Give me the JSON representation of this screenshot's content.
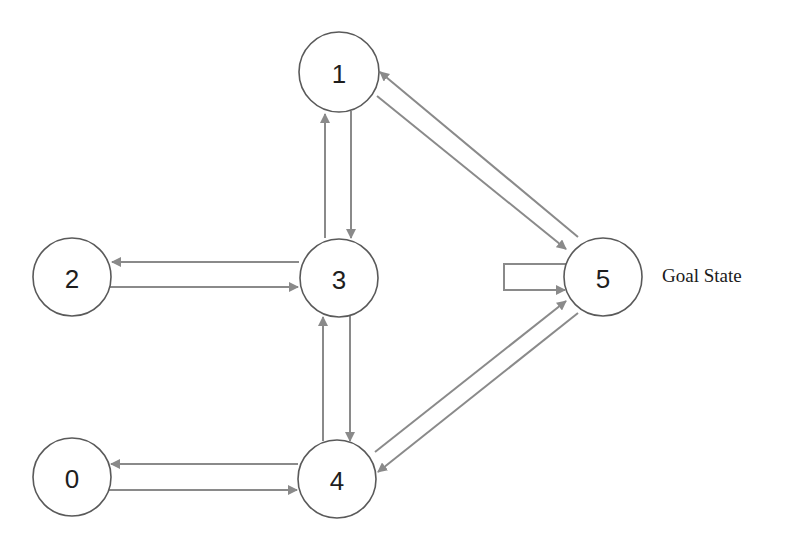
{
  "diagram": {
    "type": "state-transition-graph",
    "colors": {
      "node_stroke": "#5a5a5a",
      "node_fill": "#ffffff",
      "edge": "#8a8a8a",
      "text": "#1e1e1e"
    },
    "nodes": [
      {
        "id": "0",
        "label": "0",
        "cx": 72,
        "cy": 477,
        "r": 39
      },
      {
        "id": "1",
        "label": "1",
        "cx": 339,
        "cy": 72,
        "r": 40
      },
      {
        "id": "2",
        "label": "2",
        "cx": 72,
        "cy": 277,
        "r": 39
      },
      {
        "id": "3",
        "label": "3",
        "cx": 339,
        "cy": 278,
        "r": 39
      },
      {
        "id": "4",
        "label": "4",
        "cx": 337,
        "cy": 479,
        "r": 39
      },
      {
        "id": "5",
        "label": "5",
        "cx": 603,
        "cy": 277,
        "r": 39
      }
    ],
    "edges": [
      {
        "from": "3",
        "to": "1"
      },
      {
        "from": "1",
        "to": "3"
      },
      {
        "from": "3",
        "to": "2"
      },
      {
        "from": "2",
        "to": "3"
      },
      {
        "from": "4",
        "to": "3"
      },
      {
        "from": "3",
        "to": "4"
      },
      {
        "from": "4",
        "to": "0"
      },
      {
        "from": "0",
        "to": "4"
      },
      {
        "from": "5",
        "to": "1"
      },
      {
        "from": "1",
        "to": "5"
      },
      {
        "from": "4",
        "to": "5"
      },
      {
        "from": "5",
        "to": "4"
      },
      {
        "from": "5",
        "to": "5",
        "kind": "self-loop"
      }
    ],
    "goal_node": "5",
    "goal_label": "Goal State"
  }
}
